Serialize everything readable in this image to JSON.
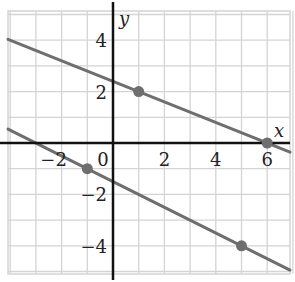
{
  "chart_data": {
    "type": "line",
    "title": "",
    "xlabel": "x",
    "ylabel": "y",
    "xlim": [
      -4,
      7
    ],
    "ylim": [
      -5,
      5
    ],
    "grid": true,
    "x_ticks": [
      {
        "value": -2,
        "label": "−2"
      },
      {
        "value": 0,
        "label": "0"
      },
      {
        "value": 2,
        "label": "2"
      },
      {
        "value": 4,
        "label": "4"
      },
      {
        "value": 6,
        "label": "6"
      }
    ],
    "y_ticks": [
      {
        "value": 4,
        "label": "4"
      },
      {
        "value": 2,
        "label": "2"
      },
      {
        "value": -2,
        "label": "−2"
      },
      {
        "value": -4,
        "label": "−4"
      }
    ],
    "series": [
      {
        "name": "upper line",
        "slope": -0.4,
        "intercept": 2.4,
        "marked_points": [
          [
            1,
            2
          ],
          [
            6,
            0
          ]
        ],
        "color": "#6e6e6e"
      },
      {
        "name": "lower line",
        "slope": -0.5,
        "intercept": -1.5,
        "marked_points": [
          [
            -1,
            -1
          ],
          [
            5,
            -4
          ]
        ],
        "color": "#6e6e6e"
      }
    ],
    "colors": {
      "grid": "#d4d4d4",
      "axis": "#111111",
      "line": "#6e6e6e",
      "point": "#6e6e6e"
    }
  }
}
